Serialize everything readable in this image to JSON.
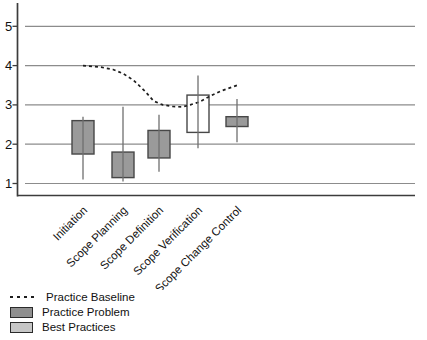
{
  "chart_data": {
    "type": "box",
    "title": "",
    "xlabel": "",
    "ylabel": "",
    "categories": [
      "Initiation",
      "Scope Planning",
      "Scope Definition",
      "Scope Verification",
      "Scope Change Control"
    ],
    "y_ticks": [
      1,
      2,
      3,
      4,
      5
    ],
    "ylim": [
      0.7,
      5.6
    ],
    "grid": true,
    "legend_position": "bottom-left",
    "boxes": [
      {
        "category": "Initiation",
        "series": "Practice Problem",
        "box_low": 1.75,
        "box_high": 2.6,
        "whisker_low": 1.1,
        "whisker_high": 2.7,
        "fill": "#9a9a9a"
      },
      {
        "category": "Scope Planning",
        "series": "Practice Problem",
        "box_low": 1.15,
        "box_high": 1.8,
        "whisker_low": 1.05,
        "whisker_high": 2.95,
        "fill": "#9a9a9a"
      },
      {
        "category": "Scope Definition",
        "series": "Practice Problem",
        "box_low": 1.65,
        "box_high": 2.35,
        "whisker_low": 1.3,
        "whisker_high": 2.75,
        "fill": "#9a9a9a"
      },
      {
        "category": "Scope Verification",
        "series": "Best Practices",
        "box_low": 2.3,
        "box_high": 3.25,
        "whisker_low": 1.9,
        "whisker_high": 3.75,
        "fill": "#ffffff"
      },
      {
        "category": "Scope Change Control",
        "series": "Practice Problem",
        "box_low": 2.45,
        "box_high": 2.7,
        "whisker_low": 2.05,
        "whisker_high": 3.15,
        "fill": "#9a9a9a"
      }
    ],
    "baseline": {
      "name": "Practice Baseline",
      "style": "dashed",
      "points": [
        [
          0.0,
          4.0
        ],
        [
          0.45,
          3.96
        ],
        [
          0.75,
          3.9
        ],
        [
          1.0,
          3.8
        ],
        [
          1.3,
          3.62
        ],
        [
          1.6,
          3.36
        ],
        [
          1.85,
          3.1
        ],
        [
          2.1,
          3.0
        ],
        [
          2.35,
          2.96
        ],
        [
          2.6,
          2.95
        ],
        [
          2.8,
          3.0
        ],
        [
          3.05,
          3.08
        ],
        [
          3.3,
          3.22
        ],
        [
          3.6,
          3.36
        ],
        [
          4.0,
          3.5
        ]
      ]
    },
    "layout": {
      "centers": [
        83,
        123,
        159,
        198,
        237
      ],
      "axis_x": 17.5,
      "grid_x0": 25,
      "grid_x1": 415,
      "axis_top": 3,
      "axis_bottom": 195.5,
      "y_of_1": 183.5,
      "px_per_unit": 39.3,
      "box_width": 22,
      "label_anchor_y": 211
    }
  },
  "colors": {
    "grid": "#8c8c8c",
    "axis": "#3c3c3c",
    "box_border": "#474747",
    "whisker": "#6f6f6f",
    "baseline": "#1d1d1d",
    "text": "#111111",
    "problem_fill": "#9a9a9a",
    "best_fill": "#c6c6c6"
  },
  "legend": {
    "items": [
      {
        "label": "Practice Baseline",
        "swatch": "dashed-line",
        "color": "#1d1d1d"
      },
      {
        "label": "Practice Problem",
        "swatch": "box",
        "color": "#8f8f8f"
      },
      {
        "label": "Best Practices",
        "swatch": "box",
        "color": "#c6c6c6"
      }
    ]
  }
}
